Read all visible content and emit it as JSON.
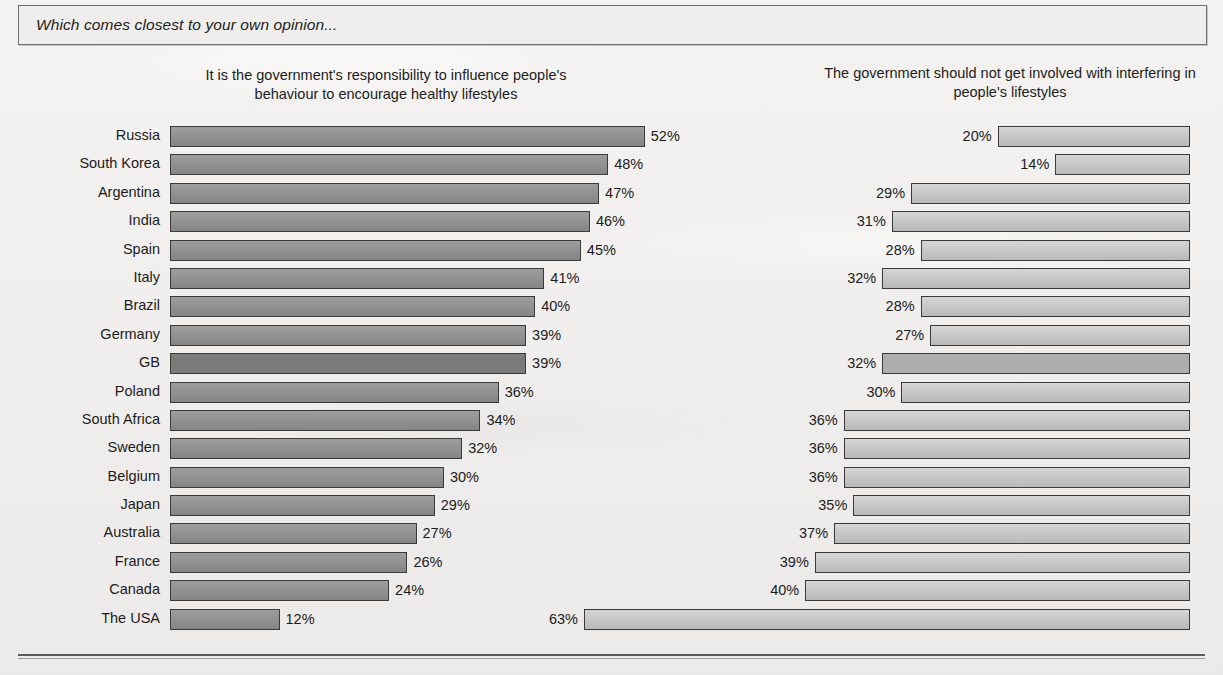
{
  "question": "Which comes closest to your own opinion...",
  "headers": {
    "left": "It is the government's responsibility to influence people's behaviour to encourage healthy lifestyles",
    "right": "The government should not get involved with interfering in people's lifestyles"
  },
  "highlight_country": "GB",
  "colors": {
    "left_bar": "#8f8f8f",
    "right_bar": "#c3c3c3",
    "left_bar_highlight": "#7b7b7b",
    "right_bar_highlight": "#adadad",
    "bar_border": "#3a3a3a",
    "page_background": "#f2f1ef",
    "text": "#1c1c1c"
  },
  "chart_data": {
    "type": "bar",
    "title": "Which comes closest to your own opinion...",
    "orientation": "horizontal",
    "layout": "diverging-paired",
    "xlabel": "",
    "ylabel": "",
    "xlim": [
      0,
      63
    ],
    "grid": false,
    "legend_position": "top",
    "value_suffix": "%",
    "categories": [
      "Russia",
      "South Korea",
      "Argentina",
      "India",
      "Spain",
      "Italy",
      "Brazil",
      "Germany",
      "GB",
      "Poland",
      "South Africa",
      "Sweden",
      "Belgium",
      "Japan",
      "Australia",
      "France",
      "Canada",
      "The USA"
    ],
    "series": [
      {
        "name": "It is the government's responsibility to influence people's behaviour to encourage healthy lifestyles",
        "side": "left",
        "values": [
          52,
          48,
          47,
          46,
          45,
          41,
          40,
          39,
          39,
          36,
          34,
          32,
          30,
          29,
          27,
          26,
          24,
          12
        ]
      },
      {
        "name": "The government should not get involved with interfering in people's lifestyles",
        "side": "right",
        "values": [
          20,
          14,
          29,
          31,
          28,
          32,
          28,
          27,
          32,
          30,
          36,
          36,
          36,
          35,
          37,
          39,
          40,
          63
        ]
      }
    ]
  },
  "rows": [
    {
      "country": "Russia",
      "left": "52%",
      "right": "20%",
      "left_v": 52,
      "right_v": 20
    },
    {
      "country": "South Korea",
      "left": "48%",
      "right": "14%",
      "left_v": 48,
      "right_v": 14
    },
    {
      "country": "Argentina",
      "left": "47%",
      "right": "29%",
      "left_v": 47,
      "right_v": 29
    },
    {
      "country": "India",
      "left": "46%",
      "right": "31%",
      "left_v": 46,
      "right_v": 31
    },
    {
      "country": "Spain",
      "left": "45%",
      "right": "28%",
      "left_v": 45,
      "right_v": 28
    },
    {
      "country": "Italy",
      "left": "41%",
      "right": "32%",
      "left_v": 41,
      "right_v": 32
    },
    {
      "country": "Brazil",
      "left": "40%",
      "right": "28%",
      "left_v": 40,
      "right_v": 28
    },
    {
      "country": "Germany",
      "left": "39%",
      "right": "27%",
      "left_v": 39,
      "right_v": 27
    },
    {
      "country": "GB",
      "left": "39%",
      "right": "32%",
      "left_v": 39,
      "right_v": 32
    },
    {
      "country": "Poland",
      "left": "36%",
      "right": "30%",
      "left_v": 36,
      "right_v": 30
    },
    {
      "country": "South Africa",
      "left": "34%",
      "right": "36%",
      "left_v": 34,
      "right_v": 36
    },
    {
      "country": "Sweden",
      "left": "32%",
      "right": "36%",
      "left_v": 32,
      "right_v": 36
    },
    {
      "country": "Belgium",
      "left": "30%",
      "right": "36%",
      "left_v": 30,
      "right_v": 36
    },
    {
      "country": "Japan",
      "left": "29%",
      "right": "35%",
      "left_v": 29,
      "right_v": 35
    },
    {
      "country": "Australia",
      "left": "27%",
      "right": "37%",
      "left_v": 27,
      "right_v": 37
    },
    {
      "country": "France",
      "left": "26%",
      "right": "39%",
      "left_v": 26,
      "right_v": 39
    },
    {
      "country": "Canada",
      "left": "24%",
      "right": "40%",
      "left_v": 24,
      "right_v": 40
    },
    {
      "country": "The USA",
      "left": "12%",
      "right": "63%",
      "left_v": 12,
      "right_v": 63
    }
  ]
}
